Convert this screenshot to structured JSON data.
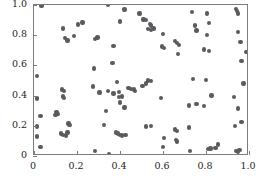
{
  "chart_data": {
    "type": "scatter",
    "title": "",
    "subtitle": "",
    "xlabel": "",
    "ylabel": "",
    "xlim": [
      0.0,
      1.0
    ],
    "ylim": [
      0.0,
      1.0
    ],
    "grid": false,
    "legend": null,
    "marker": {
      "shape": "circle",
      "color": "#5a5a5f",
      "size_px": 4.4
    },
    "frame_color": "#7d7d7d",
    "background": "#ffffff",
    "xticks": [
      0.0,
      0.2,
      0.4,
      0.6,
      0.8,
      1.0
    ],
    "xticklabels": [
      "0",
      "0.2",
      "0.4",
      "0.6",
      "0.8",
      "1.0"
    ],
    "yticks": [
      0.0,
      0.2,
      0.4,
      0.6,
      0.8,
      1.0
    ],
    "yticklabels": [
      "0",
      "0.2",
      "0.4",
      "0.6",
      "0.8",
      "1.0"
    ],
    "n_points": 120,
    "points": [
      [
        0.035,
        0.995
      ],
      [
        0.345,
        1.0
      ],
      [
        0.42,
        0.97
      ],
      [
        0.735,
        0.955
      ],
      [
        0.94,
        0.975
      ],
      [
        0.945,
        0.96
      ],
      [
        0.95,
        0.945
      ],
      [
        0.49,
        0.945
      ],
      [
        0.805,
        0.945
      ],
      [
        0.51,
        0.905
      ],
      [
        0.52,
        0.9
      ],
      [
        0.4,
        0.89
      ],
      [
        0.225,
        0.885
      ],
      [
        0.205,
        0.87
      ],
      [
        0.54,
        0.875
      ],
      [
        0.545,
        0.865
      ],
      [
        0.135,
        0.845
      ],
      [
        0.75,
        0.865
      ],
      [
        0.815,
        0.88
      ],
      [
        0.53,
        0.84
      ],
      [
        0.545,
        0.835
      ],
      [
        0.555,
        0.845
      ],
      [
        0.755,
        0.83
      ],
      [
        0.185,
        0.795
      ],
      [
        0.6,
        0.81
      ],
      [
        0.95,
        0.82
      ],
      [
        0.145,
        0.78
      ],
      [
        0.155,
        0.765
      ],
      [
        0.295,
        0.785
      ],
      [
        0.285,
        0.775
      ],
      [
        0.805,
        0.8
      ],
      [
        0.655,
        0.76
      ],
      [
        0.665,
        0.75
      ],
      [
        0.675,
        0.735
      ],
      [
        0.96,
        0.755
      ],
      [
        0.37,
        0.73
      ],
      [
        0.595,
        0.725
      ],
      [
        0.605,
        0.715
      ],
      [
        0.79,
        0.705
      ],
      [
        0.815,
        0.695
      ],
      [
        0.67,
        0.675
      ],
      [
        0.985,
        0.69
      ],
      [
        0.965,
        0.63
      ],
      [
        0.365,
        0.615
      ],
      [
        0.28,
        0.58
      ],
      [
        0.015,
        0.53
      ],
      [
        0.74,
        0.51
      ],
      [
        0.8,
        0.505
      ],
      [
        0.53,
        0.5
      ],
      [
        0.545,
        0.495
      ],
      [
        0.385,
        0.49
      ],
      [
        0.52,
        0.48
      ],
      [
        0.975,
        0.48
      ],
      [
        0.505,
        0.465
      ],
      [
        0.275,
        0.46
      ],
      [
        0.13,
        0.44
      ],
      [
        0.14,
        0.43
      ],
      [
        0.305,
        0.42
      ],
      [
        0.345,
        0.43
      ],
      [
        0.37,
        0.415
      ],
      [
        0.395,
        0.425
      ],
      [
        0.44,
        0.45
      ],
      [
        0.45,
        0.445
      ],
      [
        0.465,
        0.44
      ],
      [
        0.47,
        0.43
      ],
      [
        0.825,
        0.4
      ],
      [
        0.015,
        0.38
      ],
      [
        0.135,
        0.395
      ],
      [
        0.14,
        0.385
      ],
      [
        0.395,
        0.39
      ],
      [
        0.41,
        0.395
      ],
      [
        0.59,
        0.385
      ],
      [
        0.93,
        0.39
      ],
      [
        0.4,
        0.355
      ],
      [
        0.755,
        0.345
      ],
      [
        0.72,
        0.335
      ],
      [
        0.79,
        0.33
      ],
      [
        0.42,
        0.32
      ],
      [
        0.335,
        0.3
      ],
      [
        0.95,
        0.315
      ],
      [
        0.105,
        0.29
      ],
      [
        0.11,
        0.28
      ],
      [
        0.03,
        0.265
      ],
      [
        0.1,
        0.27
      ],
      [
        0.965,
        0.225
      ],
      [
        0.16,
        0.215
      ],
      [
        0.165,
        0.205
      ],
      [
        0.325,
        0.205
      ],
      [
        0.545,
        0.2
      ],
      [
        0.52,
        0.195
      ],
      [
        0.935,
        0.2
      ],
      [
        0.015,
        0.195
      ],
      [
        0.72,
        0.19
      ],
      [
        0.655,
        0.175
      ],
      [
        0.665,
        0.165
      ],
      [
        0.155,
        0.155
      ],
      [
        0.125,
        0.15
      ],
      [
        0.135,
        0.14
      ],
      [
        0.15,
        0.135
      ],
      [
        0.39,
        0.15
      ],
      [
        0.4,
        0.14
      ],
      [
        0.41,
        0.135
      ],
      [
        0.425,
        0.14
      ],
      [
        0.38,
        0.155
      ],
      [
        0.015,
        0.13
      ],
      [
        0.605,
        0.12
      ],
      [
        0.66,
        0.105
      ],
      [
        0.665,
        0.095
      ],
      [
        0.855,
        0.075
      ],
      [
        0.03,
        0.06
      ],
      [
        0.6,
        0.06
      ],
      [
        0.845,
        0.055
      ],
      [
        0.81,
        0.045
      ],
      [
        0.82,
        0.05
      ],
      [
        0.725,
        0.035
      ],
      [
        0.285,
        0.035
      ],
      [
        0.94,
        0.035
      ],
      [
        0.95,
        0.03
      ],
      [
        0.955,
        0.04
      ],
      [
        0.35,
        0.015
      ]
    ]
  },
  "caption": {
    "fragment": ""
  }
}
